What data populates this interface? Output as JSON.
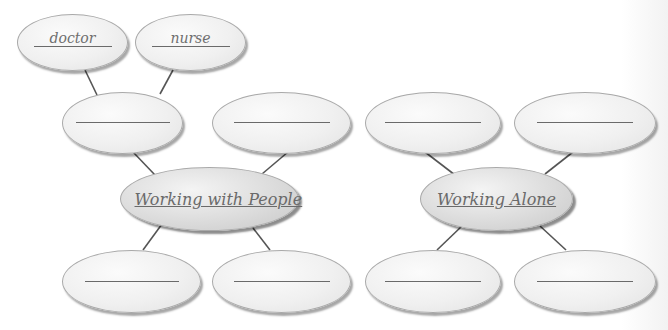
{
  "diagram": {
    "maps": [
      {
        "center": {
          "label": "Working with People"
        },
        "branches": [
          {
            "label": "",
            "sub_branches": [
              {
                "label": "doctor"
              },
              {
                "label": "nurse"
              }
            ]
          },
          {
            "label": ""
          },
          {
            "label": ""
          },
          {
            "label": ""
          }
        ]
      },
      {
        "center": {
          "label": "Working Alone"
        },
        "branches": [
          {
            "label": ""
          },
          {
            "label": ""
          },
          {
            "label": ""
          },
          {
            "label": ""
          }
        ]
      }
    ]
  },
  "colors": {
    "bubble_fill": "#f0f0f0",
    "center_fill": "#d8d8d8",
    "outline": "#a9a9a9",
    "connector": "#555555",
    "text": "#6f6f6f"
  }
}
